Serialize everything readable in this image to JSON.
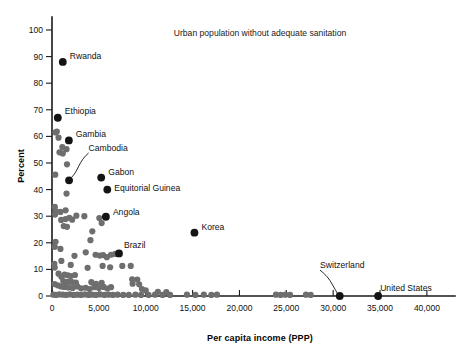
{
  "chart_data": {
    "type": "scatter",
    "title": "Urban population without adequate sanitation",
    "xlabel": "Per capita income (PPP)",
    "ylabel": "Percent",
    "xlim": [
      0,
      43000
    ],
    "ylim": [
      0,
      103
    ],
    "grid": false,
    "legend": "none",
    "xticks": [
      0,
      5000,
      10000,
      15000,
      20000,
      25000,
      30000,
      35000,
      40000
    ],
    "xticklabels": [
      "0",
      "5,000",
      "10,000",
      "15,000",
      "20,000",
      "25,000",
      "30,000",
      "35,000",
      "40,000"
    ],
    "yticks": [
      0,
      10,
      20,
      30,
      40,
      50,
      60,
      70,
      80,
      90,
      100
    ],
    "yticklabels": [
      "0",
      "10",
      "20",
      "30",
      "40",
      "50",
      "60",
      "70",
      "80",
      "90",
      "100"
    ],
    "marker_colors": {
      "labeled": "#141414",
      "unlabeled": "#6e6e6e",
      "axis": "#1a1a1a"
    },
    "labeled_points": [
      {
        "name": "Rwanda",
        "x": 1150,
        "y": 88,
        "label_dx": 7,
        "label_dy": -3,
        "leader": false
      },
      {
        "name": "Ethiopia",
        "x": 620,
        "y": 67,
        "label_dx": 7,
        "label_dy": -4,
        "leader": false
      },
      {
        "name": "Gambia",
        "x": 1800,
        "y": 58.5,
        "label_dx": 7,
        "label_dy": -3,
        "leader": false
      },
      {
        "name": "Cambodia",
        "x": 1820,
        "y": 43.5,
        "label_dx": 0,
        "label_dy": 0,
        "leader": true,
        "label_x": 3900,
        "label_y": 54.5
      },
      {
        "name": "Gabon",
        "x": 5250,
        "y": 44.5,
        "label_dx": 7,
        "label_dy": -3,
        "leader": false
      },
      {
        "name": "Equitorial Guinea",
        "x": 5900,
        "y": 40,
        "label_dx": 7,
        "label_dy": 1,
        "leader": false
      },
      {
        "name": "Angola",
        "x": 5750,
        "y": 29.8,
        "label_dx": 7,
        "label_dy": -2,
        "leader": false
      },
      {
        "name": "Korea",
        "x": 15200,
        "y": 23.8,
        "label_dx": 7,
        "label_dy": -3,
        "leader": false
      },
      {
        "name": "Brazil",
        "x": 7150,
        "y": 16,
        "label_dx": 5,
        "label_dy": -5,
        "leader": false
      },
      {
        "name": "Switzerland",
        "x": 30700,
        "y": 0,
        "label_dx": 0,
        "label_dy": 0,
        "leader": true,
        "label_x": 28600,
        "label_y": 10.5
      },
      {
        "name": "United States",
        "x": 34800,
        "y": 0,
        "label_dx": 2,
        "label_dy": -5,
        "leader": false
      }
    ],
    "unlabeled_points": [
      [
        380,
        61.5
      ],
      [
        520,
        61.8
      ],
      [
        700,
        59.5
      ],
      [
        1100,
        56.0
      ],
      [
        1550,
        55.2
      ],
      [
        800,
        54.0
      ],
      [
        1150,
        53.6
      ],
      [
        1600,
        49.5
      ],
      [
        350,
        45.6
      ],
      [
        1550,
        38.5
      ],
      [
        300,
        33.5
      ],
      [
        420,
        31.8
      ],
      [
        900,
        31.6
      ],
      [
        1450,
        32.2
      ],
      [
        2600,
        30.2
      ],
      [
        3450,
        30.0
      ],
      [
        5050,
        29.3
      ],
      [
        330,
        30.6
      ],
      [
        980,
        28.6
      ],
      [
        1450,
        28.9
      ],
      [
        1850,
        29.4
      ],
      [
        2150,
        28.7
      ],
      [
        1250,
        26.3
      ],
      [
        1600,
        26.0
      ],
      [
        5300,
        27.4
      ],
      [
        4300,
        24.3
      ],
      [
        380,
        20.4
      ],
      [
        300,
        18.5
      ],
      [
        4100,
        21.0
      ],
      [
        900,
        17.7
      ],
      [
        3600,
        16.4
      ],
      [
        2400,
        15.1
      ],
      [
        4650,
        15.5
      ],
      [
        5100,
        15.2
      ],
      [
        5450,
        15.4
      ],
      [
        5850,
        14.6
      ],
      [
        6300,
        15.5
      ],
      [
        6750,
        15.8
      ],
      [
        250,
        12.1
      ],
      [
        290,
        10.7
      ],
      [
        1000,
        13.2
      ],
      [
        2000,
        11.7
      ],
      [
        3800,
        10.6
      ],
      [
        5400,
        11.3
      ],
      [
        6200,
        10.8
      ],
      [
        7500,
        11.3
      ],
      [
        8400,
        11.3
      ],
      [
        700,
        8.4
      ],
      [
        1000,
        7.2
      ],
      [
        1350,
        8.0
      ],
      [
        1700,
        7.8
      ],
      [
        2000,
        7.5
      ],
      [
        2450,
        7.9
      ],
      [
        1200,
        5.6
      ],
      [
        1500,
        5.2
      ],
      [
        1800,
        5.4
      ],
      [
        2150,
        5.2
      ],
      [
        2550,
        5.0
      ],
      [
        4200,
        5.2
      ],
      [
        4700,
        4.6
      ],
      [
        5300,
        4.9
      ],
      [
        8550,
        6.3
      ],
      [
        9100,
        6.2
      ],
      [
        8600,
        4.6
      ],
      [
        9300,
        4.4
      ],
      [
        280,
        4.5
      ],
      [
        600,
        4.0
      ],
      [
        950,
        3.6
      ],
      [
        1300,
        3.4
      ],
      [
        1750,
        3.2
      ],
      [
        2200,
        3.0
      ],
      [
        2700,
        3.6
      ],
      [
        3100,
        2.9
      ],
      [
        3600,
        3.1
      ],
      [
        4000,
        2.6
      ],
      [
        4500,
        3.3
      ],
      [
        5000,
        3.0
      ],
      [
        5500,
        3.4
      ],
      [
        5900,
        2.8
      ],
      [
        6300,
        3.3
      ],
      [
        9600,
        2.6
      ],
      [
        10000,
        2.1
      ],
      [
        11300,
        1.6
      ],
      [
        12200,
        1.5
      ],
      [
        150,
        0.5
      ],
      [
        430,
        0.4
      ],
      [
        780,
        0.6
      ],
      [
        1150,
        0.5
      ],
      [
        1500,
        0.4
      ],
      [
        1900,
        0.6
      ],
      [
        2300,
        0.4
      ],
      [
        2700,
        0.5
      ],
      [
        3100,
        0.4
      ],
      [
        3500,
        0.6
      ],
      [
        3900,
        0.4
      ],
      [
        4300,
        0.5
      ],
      [
        4700,
        0.4
      ],
      [
        5150,
        0.6
      ],
      [
        5600,
        0.4
      ],
      [
        6050,
        0.5
      ],
      [
        6500,
        0.4
      ],
      [
        7000,
        0.5
      ],
      [
        7600,
        0.4
      ],
      [
        8200,
        0.4
      ],
      [
        8900,
        0.5
      ],
      [
        9500,
        0.4
      ],
      [
        10300,
        0.4
      ],
      [
        11000,
        0.5
      ],
      [
        11800,
        0.4
      ],
      [
        12600,
        0.4
      ],
      [
        14400,
        0.5
      ],
      [
        15300,
        0.4
      ],
      [
        16200,
        0.5
      ],
      [
        17000,
        0.4
      ],
      [
        17600,
        0.5
      ],
      [
        23900,
        0.5
      ],
      [
        24400,
        0.4
      ],
      [
        24900,
        0.5
      ],
      [
        25400,
        0.4
      ],
      [
        27100,
        0.5
      ],
      [
        27600,
        0.4
      ]
    ]
  }
}
